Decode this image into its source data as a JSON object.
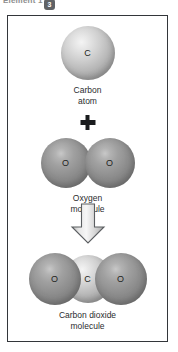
{
  "header": {
    "label": "Element 1",
    "badge": "3"
  },
  "figure": {
    "operator_plus": "+",
    "arrow_icon": "down-arrow-icon",
    "reactants": [
      {
        "id": "carbon-atom",
        "caption_line1": "Carbon",
        "caption_line2": "atom",
        "atoms": [
          {
            "symbol": "C",
            "kind": "light"
          }
        ]
      },
      {
        "id": "oxygen-molecule",
        "caption_line1": "Oxygen",
        "caption_line2": "molecule",
        "atoms": [
          {
            "symbol": "O",
            "kind": "dark"
          },
          {
            "symbol": "O",
            "kind": "dark"
          }
        ]
      }
    ],
    "product": {
      "id": "carbon-dioxide-molecule",
      "caption_line1": "Carbon dioxide",
      "caption_line2": "molecule",
      "atoms": [
        {
          "symbol": "O",
          "kind": "dark"
        },
        {
          "symbol": "C",
          "kind": "light"
        },
        {
          "symbol": "O",
          "kind": "dark"
        }
      ]
    }
  },
  "colors": {
    "frame_border": "#33363a",
    "background": "#ffffff",
    "atom_light": "#cfcfcf",
    "atom_dark": "#8f8f8f",
    "text": "#2a2c2e",
    "badge_bg": "#5f6266"
  }
}
